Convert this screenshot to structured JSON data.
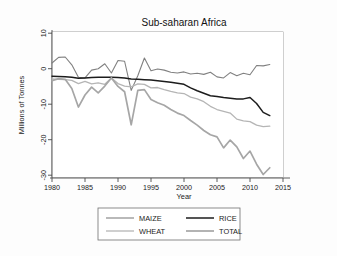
{
  "chart_data": {
    "type": "line",
    "title": "Sub-saharan Africa",
    "xlabel": "Year",
    "ylabel": "Millions of Tonnes",
    "xlim": [
      1980,
      2015
    ],
    "ylim": [
      -32,
      10
    ],
    "xticks": [
      1980,
      1985,
      1990,
      1995,
      2000,
      2005,
      2010,
      2015
    ],
    "yticks": [
      10,
      0,
      -10,
      -20,
      -30
    ],
    "grid": false,
    "legend_position": "below-axes",
    "x": [
      1980,
      1981,
      1982,
      1983,
      1984,
      1985,
      1986,
      1987,
      1988,
      1989,
      1990,
      1991,
      1992,
      1993,
      1994,
      1995,
      1996,
      1997,
      1998,
      1999,
      2000,
      2001,
      2002,
      2003,
      2004,
      2005,
      2006,
      2007,
      2008,
      2009,
      2010,
      2011,
      2012,
      2013
    ],
    "series": [
      {
        "name": "MAIZE",
        "color": "#808080",
        "width": 1.1,
        "values": [
          1.6,
          3.2,
          3.3,
          1.1,
          -2.4,
          -2.6,
          -0.4,
          0.0,
          1.4,
          -1.2,
          2.3,
          2.1,
          -6.1,
          -2.0,
          3.0,
          -0.6,
          -0.1,
          -0.4,
          -1.0,
          -1.2,
          -0.9,
          -1.5,
          -1.3,
          -1.6,
          -1.0,
          -2.3,
          -2.6,
          -1.1,
          -2.0,
          -1.3,
          -1.7,
          0.9,
          0.8,
          1.2
        ]
      },
      {
        "name": "RICE",
        "color": "#1c1c1c",
        "width": 1.5,
        "values": [
          -2.1,
          -2.2,
          -2.3,
          -2.4,
          -2.7,
          -2.6,
          -2.5,
          -2.4,
          -2.4,
          -2.4,
          -2.5,
          -2.6,
          -2.9,
          -3.0,
          -3.1,
          -3.2,
          -3.4,
          -3.6,
          -3.8,
          -4.1,
          -4.4,
          -5.4,
          -6.2,
          -6.9,
          -7.6,
          -7.8,
          -8.1,
          -8.3,
          -8.5,
          -8.5,
          -8.1,
          -9.8,
          -12.3,
          -13.2
        ]
      },
      {
        "name": "WHEAT",
        "color": "#b5b5b5",
        "width": 1.3,
        "values": [
          -2.9,
          -3.0,
          -3.1,
          -3.3,
          -4.2,
          -3.6,
          -4.3,
          -4.0,
          -4.4,
          -2.6,
          -4.2,
          -4.9,
          -5.1,
          -4.3,
          -4.4,
          -5.4,
          -5.3,
          -5.9,
          -6.4,
          -6.8,
          -7.0,
          -8.0,
          -8.5,
          -9.3,
          -10.6,
          -11.5,
          -12.0,
          -12.5,
          -14.2,
          -14.7,
          -14.9,
          -15.9,
          -16.3,
          -16.2
        ]
      },
      {
        "name": "TOTAL",
        "color": "#a6a6a6",
        "width": 1.7,
        "values": [
          -3.4,
          -2.8,
          -3.0,
          -5.6,
          -10.8,
          -7.4,
          -5.2,
          -6.8,
          -4.9,
          -2.6,
          -5.0,
          -6.5,
          -15.8,
          -6.1,
          -5.9,
          -8.7,
          -9.6,
          -10.3,
          -11.5,
          -12.5,
          -13.2,
          -14.6,
          -15.9,
          -17.4,
          -18.6,
          -19.2,
          -22.3,
          -20.1,
          -22.0,
          -25.3,
          -23.2,
          -26.9,
          -29.8,
          -27.9
        ]
      }
    ],
    "legend_entries": [
      {
        "label": "MAIZE",
        "color": "#808080",
        "width": 1.1
      },
      {
        "label": "RICE",
        "color": "#1c1c1c",
        "width": 1.5
      },
      {
        "label": "WHEAT",
        "color": "#b5b5b5",
        "width": 1.3
      },
      {
        "label": "TOTAL",
        "color": "#a6a6a6",
        "width": 1.7
      }
    ]
  }
}
